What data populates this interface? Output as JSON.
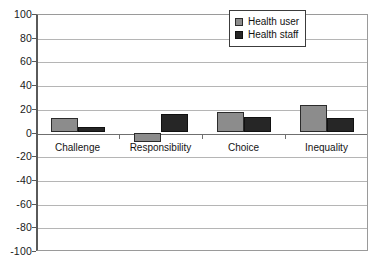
{
  "chart_data": {
    "type": "bar",
    "title": "",
    "subtitle": "",
    "xlabel": "",
    "ylabel": "",
    "categories": [
      "Challenge",
      "Responsibility",
      "Choice",
      "Inequality"
    ],
    "series": [
      {
        "name": "Health user",
        "color": "#8c8c8c",
        "values": [
          12,
          -8,
          17,
          23
        ]
      },
      {
        "name": "Health staff",
        "color": "#262626",
        "values": [
          5,
          16,
          13,
          12
        ]
      }
    ],
    "ylim": [
      -100,
      100
    ],
    "yticks": [
      100,
      80,
      60,
      40,
      20,
      0,
      -20,
      -40,
      -60,
      -80,
      -100
    ],
    "ytick_labels": [
      "100",
      "80",
      "60",
      "40",
      "20",
      "0",
      "-20",
      "-40",
      "-60",
      "-80",
      "-100"
    ],
    "grid": true,
    "grid_axis": "y",
    "legend": {
      "position": "top-right",
      "entries": [
        "Health user",
        "Health staff"
      ]
    },
    "plot_background": "#ffffff",
    "grid_color": "#b5b5b5",
    "axis_color": "#5a5a5a"
  }
}
